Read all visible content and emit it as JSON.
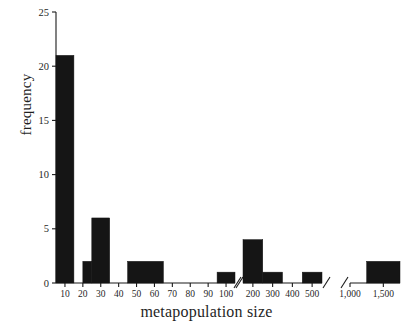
{
  "chart_data": {
    "type": "bar",
    "title": "",
    "subtitle": "",
    "xlabel": "metapopulation size",
    "ylabel": "frequency",
    "ylim": [
      0,
      25
    ],
    "yticks": [
      0,
      5,
      10,
      15,
      20,
      25
    ],
    "ytick_labels": [
      "0",
      "5",
      "10",
      "15",
      "20",
      "25"
    ],
    "grid": false,
    "legend": null,
    "axis_broken": true,
    "x_segments": [
      {
        "name": "segment-1",
        "ticks": [
          10,
          20,
          30,
          40,
          50,
          60,
          70,
          80,
          90,
          100
        ],
        "tick_labels": [
          "10",
          "20",
          "30",
          "40",
          "50",
          "60",
          "70",
          "80",
          "90",
          "100"
        ],
        "break_right": true,
        "break_left": false
      },
      {
        "name": "segment-2",
        "ticks": [
          200,
          300,
          400,
          500
        ],
        "tick_labels": [
          "200",
          "300",
          "400",
          "500"
        ],
        "break_right": true,
        "break_left": true
      },
      {
        "name": "segment-3",
        "ticks": [
          1000,
          1500
        ],
        "tick_labels": [
          "1,000",
          "1,500"
        ],
        "break_right": false,
        "break_left": true
      }
    ],
    "bins": [
      {
        "segment": 1,
        "x_start": 5,
        "x_end": 15,
        "value": 21
      },
      {
        "segment": 1,
        "x_start": 20,
        "x_end": 25,
        "value": 2
      },
      {
        "segment": 1,
        "x_start": 25,
        "x_end": 35,
        "value": 6
      },
      {
        "segment": 1,
        "x_start": 45,
        "x_end": 65,
        "value": 2
      },
      {
        "segment": 1,
        "x_start": 95,
        "x_end": 105,
        "value": 1
      },
      {
        "segment": 2,
        "x_start": 150,
        "x_end": 250,
        "value": 4
      },
      {
        "segment": 2,
        "x_start": 250,
        "x_end": 350,
        "value": 1
      },
      {
        "segment": 2,
        "x_start": 450,
        "x_end": 550,
        "value": 1
      },
      {
        "segment": 3,
        "x_start": 1250,
        "x_end": 1750,
        "value": 2
      }
    ],
    "categories": [
      "5-15",
      "20-25",
      "25-35",
      "45-65",
      "95-105",
      "150-250",
      "250-350",
      "450-550",
      "1250-1750"
    ],
    "values": [
      21,
      2,
      6,
      2,
      1,
      4,
      1,
      1,
      2
    ],
    "colors": {
      "bar": "#151515",
      "axis": "#1a1a1a",
      "text": "#1f1f1f",
      "background": "#ffffff"
    }
  }
}
